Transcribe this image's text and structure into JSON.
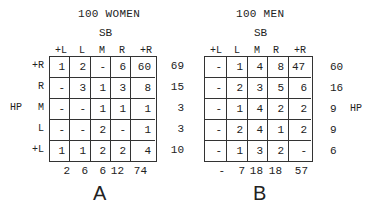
{
  "panelA": {
    "title": "100 WOMEN",
    "subtitle": "SB",
    "label": "A",
    "col_headers": [
      "+L",
      "L",
      "M",
      "R",
      "+R"
    ],
    "row_headers": [
      "+R",
      "R",
      "M",
      "L",
      "+L"
    ],
    "side_label": "HP",
    "rows": [
      [
        "1",
        "2",
        "-",
        "6",
        "60"
      ],
      [
        "-",
        "3",
        "1",
        "3",
        "8"
      ],
      [
        "-",
        "-",
        "1",
        "1",
        "1"
      ],
      [
        "-",
        "-",
        "2",
        "-",
        "1"
      ],
      [
        "1",
        "1",
        "2",
        "2",
        "4"
      ]
    ],
    "row_totals": [
      "69",
      "15",
      "3",
      "3",
      "10"
    ],
    "col_totals": [
      "2",
      "6",
      "6",
      "12",
      "74"
    ]
  },
  "panelB": {
    "title": "100 MEN",
    "subtitle": "SB",
    "label": "B",
    "col_headers": [
      "+L",
      "L",
      "M",
      "R",
      "+R"
    ],
    "side_label": "HP",
    "rows": [
      [
        "-",
        "1",
        "4",
        "8",
        "47"
      ],
      [
        "-",
        "2",
        "3",
        "5",
        "6"
      ],
      [
        "-",
        "1",
        "4",
        "2",
        "2"
      ],
      [
        "-",
        "2",
        "4",
        "1",
        "2"
      ],
      [
        "-",
        "1",
        "3",
        "2",
        "-"
      ]
    ],
    "row_totals": [
      "60",
      "16",
      "9",
      "9",
      "6"
    ],
    "col_totals": [
      "-",
      "7",
      "18",
      "18",
      "57"
    ]
  }
}
